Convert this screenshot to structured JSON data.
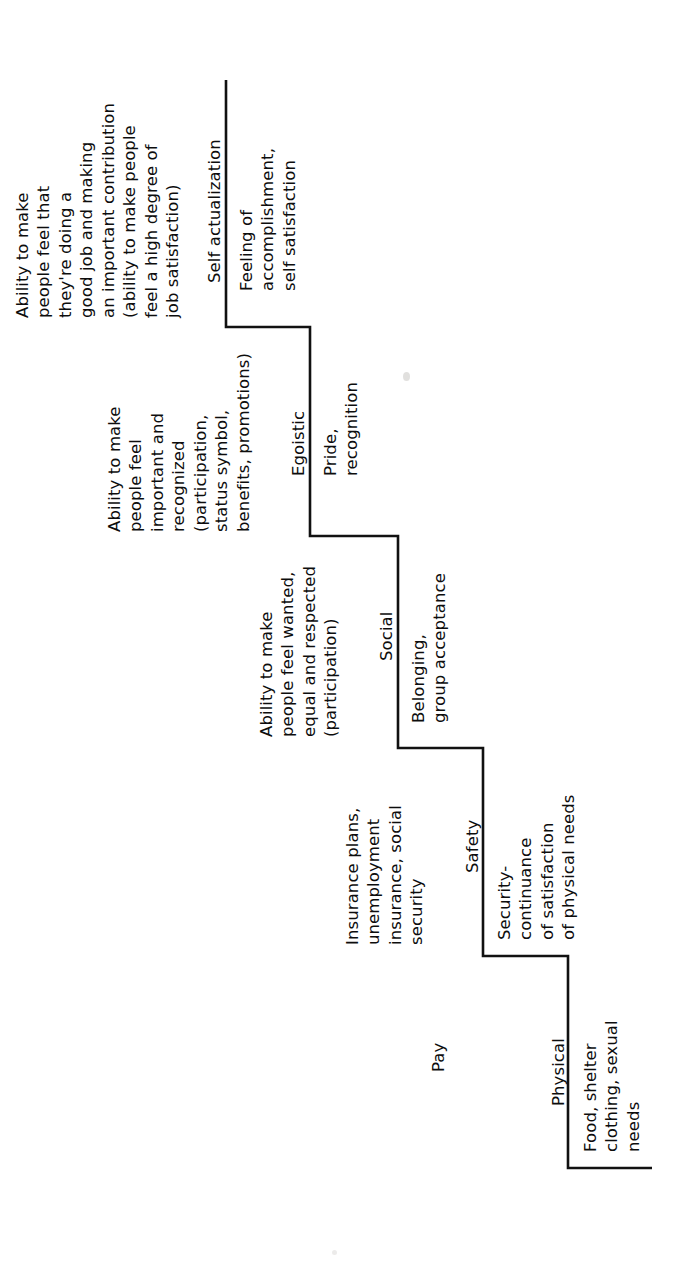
{
  "diagram": {
    "orientation": "rotated-90-ccw",
    "line_color": "#111111",
    "background_color": "#ffffff"
  },
  "levels": [
    {
      "id": "self-actualization",
      "name": "Self actualization",
      "description": [
        "Feeling of",
        "accomplishment,",
        "self satisfaction"
      ],
      "manager_note": [
        "Ability to make",
        "people feel that",
        "they're doing a",
        "good job and making",
        "an important contribution",
        "(ability to make people",
        "feel a high degree of",
        "job satisfaction)"
      ]
    },
    {
      "id": "egoistic",
      "name": "Egoistic",
      "description": [
        "Pride,",
        "recognition"
      ],
      "manager_note": [
        "Ability to make",
        "people feel",
        "important and",
        "recognized",
        "(participation,",
        "status symbol,",
        "benefits, promotions)"
      ]
    },
    {
      "id": "social",
      "name": "Social",
      "description": [
        "Belonging,",
        "group acceptance"
      ],
      "manager_note": [
        "Ability to make",
        "people feel wanted,",
        "equal and respected",
        "(participation)"
      ]
    },
    {
      "id": "safety",
      "name": "Safety",
      "description": [
        "Security-",
        "continuance",
        "of satisfaction",
        "of physical needs"
      ],
      "manager_note": [
        "Insurance plans,",
        "unemployment",
        "insurance, social",
        "security"
      ]
    },
    {
      "id": "physical",
      "name": "Physical",
      "description": [
        "Food, shelter",
        "clothing, sexual",
        "needs"
      ],
      "manager_note": [
        "Pay"
      ]
    }
  ]
}
